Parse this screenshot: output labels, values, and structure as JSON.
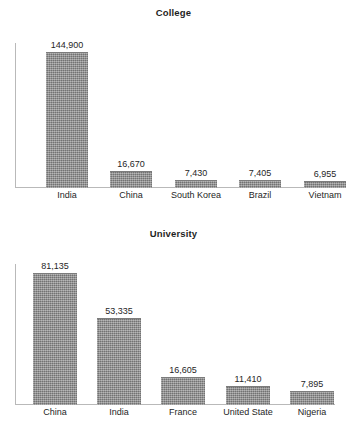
{
  "page": {
    "background_color": "#ffffff",
    "bar_color": "#8a8a8a",
    "axis_color": "#b9b9b9",
    "text_color": "#262626"
  },
  "chart_data": [
    {
      "id": "college",
      "type": "bar",
      "title": "College",
      "xlabel": "",
      "ylabel": "",
      "grid": false,
      "legend": "none",
      "ylim": [
        0,
        144900
      ],
      "categories": [
        "India",
        "China",
        "South Korea",
        "Brazil",
        "Vietnam"
      ],
      "values": [
        144900,
        16670,
        7430,
        7405,
        6955
      ],
      "value_labels": [
        "144,900",
        "16,670",
        "7,430",
        "7,405",
        "6,955"
      ]
    },
    {
      "id": "university",
      "type": "bar",
      "title": "University",
      "xlabel": "",
      "ylabel": "",
      "grid": false,
      "legend": "none",
      "ylim": [
        0,
        81135
      ],
      "categories": [
        "China",
        "India",
        "France",
        "United State",
        "Nigeria"
      ],
      "values": [
        81135,
        53335,
        16605,
        11410,
        7895
      ],
      "value_labels": [
        "81,135",
        "53,335",
        "16,605",
        "11,410",
        "7,895"
      ]
    }
  ]
}
